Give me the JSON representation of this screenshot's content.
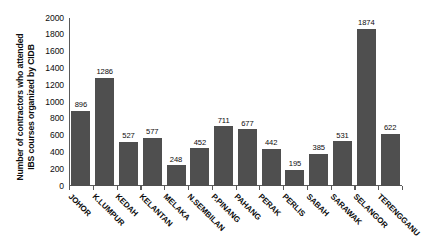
{
  "chart_data": {
    "type": "bar",
    "title": "",
    "subtitle": "",
    "xlabel": "",
    "ylabel": "Number of contractors who attended IBS courses organized by CIDB",
    "ylabel_lines": [
      "Number of contractors who attended",
      "IBS courses organized by CIDB"
    ],
    "categories": [
      "JOHOR",
      "K.LUMPUR",
      "KEDAH",
      "KELANTAN",
      "MELAKA",
      "N.SEMBILAN",
      "P.PINANG",
      "PAHANG",
      "PERAK",
      "PERLIS",
      "SABAH",
      "SARAWAK",
      "SELANGOR",
      "TERENGGANU"
    ],
    "values": [
      896,
      1286,
      527,
      577,
      248,
      452,
      711,
      677,
      442,
      195,
      385,
      531,
      1874,
      622
    ],
    "ylim": [
      0,
      2000
    ],
    "ytick_labels": [
      "2000",
      "1800",
      "1600",
      "1400",
      "1200",
      "1000",
      "800",
      "600",
      "400",
      "200",
      "0"
    ],
    "yticks": [
      2000,
      1800,
      1600,
      1400,
      1200,
      1000,
      800,
      600,
      400,
      200,
      0
    ],
    "grid": false,
    "legend": "none",
    "bar_color": "#4f4f4f",
    "axis_color": "#5a5a5a",
    "background_color": "#ffffff",
    "data_labels_shown": true
  }
}
